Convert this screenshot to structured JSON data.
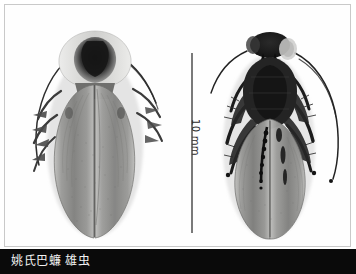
{
  "plate": {
    "background_color": "#ffffff",
    "border_color": "#c9c9c9",
    "caption_bar_color": "#0a0a0a",
    "caption_text_color": "#f2f2f2"
  },
  "caption": {
    "text": "姚氏巴蠊 雄虫"
  },
  "scale": {
    "label": "10 mm",
    "bar_color": "#7a7a7a"
  },
  "specimens": [
    {
      "id": "left",
      "view": "dorsal",
      "body_color": "#8e8e8e",
      "dark_color": "#2a2a2a",
      "pronotum_color": "#d8d8d6"
    },
    {
      "id": "right",
      "view": "ventral",
      "body_color": "#8a8a8a",
      "dark_color": "#1f1f1f",
      "pronotum_color": "#cfcfcd"
    }
  ]
}
